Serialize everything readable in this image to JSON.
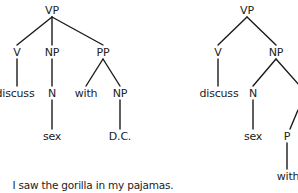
{
  "trees": [
    {
      "id": "left-tree",
      "nodes": [
        {
          "label": "VP",
          "x": 52,
          "y": 10
        },
        {
          "label": "V",
          "x": 17,
          "y": 52
        },
        {
          "label": "NP",
          "x": 52,
          "y": 52
        },
        {
          "label": "PP",
          "x": 103,
          "y": 52
        },
        {
          "label": "discuss",
          "x": 15,
          "y": 93
        },
        {
          "label": "N",
          "x": 52,
          "y": 93
        },
        {
          "label": "with",
          "x": 86,
          "y": 93
        },
        {
          "label": "NP",
          "x": 120,
          "y": 93
        },
        {
          "label": "sex",
          "x": 52,
          "y": 136
        },
        {
          "label": "D.C.",
          "x": 120,
          "y": 136
        }
      ],
      "edges": [
        [
          52,
          17,
          17,
          45
        ],
        [
          52,
          17,
          52,
          45
        ],
        [
          52,
          17,
          103,
          45
        ],
        [
          17,
          59,
          17,
          86
        ],
        [
          52,
          59,
          52,
          86
        ],
        [
          103,
          59,
          86,
          86
        ],
        [
          103,
          59,
          120,
          86
        ],
        [
          52,
          100,
          52,
          129
        ],
        [
          120,
          100,
          120,
          129
        ]
      ]
    },
    {
      "id": "right-tree",
      "nodes": [
        {
          "label": "VP",
          "x": 247,
          "y": 10
        },
        {
          "label": "V",
          "x": 218,
          "y": 52
        },
        {
          "label": "NP",
          "x": 276,
          "y": 52
        },
        {
          "label": "discuss",
          "x": 219,
          "y": 93
        },
        {
          "label": "N",
          "x": 253,
          "y": 93
        },
        {
          "label": "sex",
          "x": 253,
          "y": 136
        },
        {
          "label": "P",
          "x": 287,
          "y": 136
        },
        {
          "label": "with",
          "x": 288,
          "y": 176
        }
      ],
      "edges": [
        [
          247,
          17,
          218,
          45
        ],
        [
          247,
          17,
          276,
          45
        ],
        [
          218,
          59,
          218,
          86
        ],
        [
          276,
          59,
          253,
          86
        ],
        [
          276,
          59,
          300,
          86
        ],
        [
          253,
          100,
          253,
          129
        ],
        [
          298,
          110,
          290,
          129
        ],
        [
          287,
          143,
          287,
          169
        ]
      ]
    }
  ],
  "sentence": {
    "text": "I saw the gorilla in my pajamas.",
    "x": 93,
    "y": 185
  }
}
